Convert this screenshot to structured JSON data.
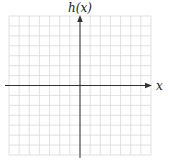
{
  "chart_data": {
    "type": "line",
    "title": "",
    "xlabel": "x",
    "ylabel": "h(x)",
    "grid": true,
    "grid_cells": {
      "cols": 14,
      "rows": 14
    },
    "xlim": [
      -7,
      7
    ],
    "ylim": [
      -7,
      7
    ],
    "series": [],
    "tick_labels": {
      "x": [],
      "y": []
    },
    "legend": null
  },
  "colors": {
    "grid": "#d9d9d9",
    "axis": "#333333",
    "background": "#ffffff"
  }
}
